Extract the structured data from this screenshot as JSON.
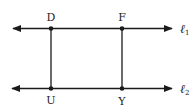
{
  "diagram": {
    "type": "geometry",
    "lines": [
      {
        "id": "l1",
        "label": "ℓ",
        "subscript": "1",
        "y": 28,
        "x1": 13,
        "x2": 172
      },
      {
        "id": "l2",
        "label": "ℓ",
        "subscript": "2",
        "y": 88,
        "x1": 12,
        "x2": 172
      }
    ],
    "points": [
      {
        "id": "D",
        "label": "D",
        "x": 51,
        "y": 28
      },
      {
        "id": "F",
        "label": "F",
        "x": 122,
        "y": 29
      },
      {
        "id": "U",
        "label": "U",
        "x": 51,
        "y": 88
      },
      {
        "id": "Y",
        "label": "Y",
        "x": 122,
        "y": 89
      }
    ],
    "segments": [
      {
        "from": "D",
        "to": "U"
      },
      {
        "from": "F",
        "to": "Y"
      }
    ],
    "colors": {
      "stroke": "#1a1a1a",
      "background": "#ffffff"
    }
  }
}
